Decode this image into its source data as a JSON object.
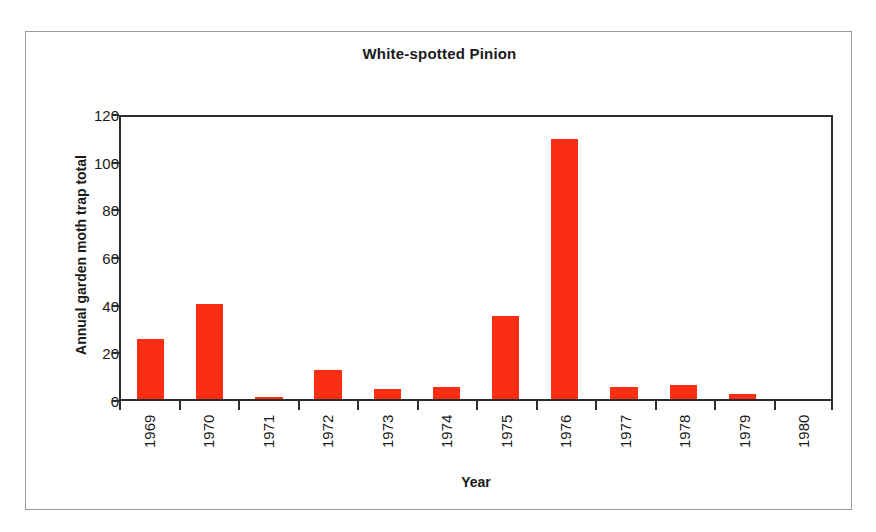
{
  "chart_data": {
    "type": "bar",
    "title": "White-spotted Pinion",
    "xlabel": "Year",
    "ylabel": "Annual garden moth trap total",
    "categories": [
      "1969",
      "1970",
      "1971",
      "1972",
      "1973",
      "1974",
      "1975",
      "1976",
      "1977",
      "1978",
      "1979",
      "1980"
    ],
    "values": [
      25,
      40,
      1,
      12,
      4,
      5,
      35,
      109,
      5,
      6,
      2,
      0
    ],
    "ylim": [
      0,
      120
    ],
    "yticks": [
      0,
      20,
      40,
      60,
      80,
      100,
      120
    ],
    "ytick_labels": [
      "0",
      "20",
      "40",
      "60",
      "80",
      "100",
      "120"
    ],
    "grid": false,
    "legend": null,
    "bar_color": "#fb2e14",
    "axis_color": "#2b2b2b",
    "frame_color": "#9a9a9a",
    "text_color": "#1a1a1a"
  }
}
